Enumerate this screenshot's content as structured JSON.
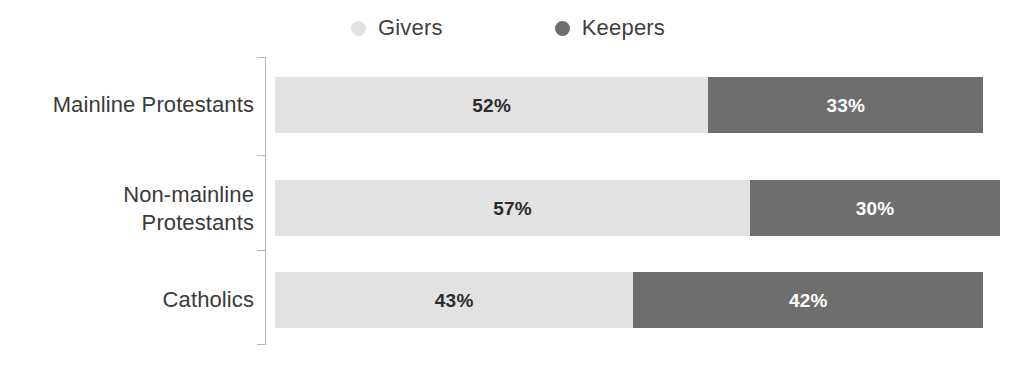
{
  "legend": {
    "position": "top-center",
    "items": [
      {
        "label": "Givers",
        "color": "#e2e2e2",
        "icon": "circle-marker-icon"
      },
      {
        "label": "Keepers",
        "color": "#6e6e6e",
        "icon": "circle-marker-icon"
      }
    ]
  },
  "colors": {
    "givers": "#e2e2e2",
    "keepers": "#6e6e6e",
    "axis": "#b8b8b8",
    "category_label": "#3a3a3a",
    "legend_label": "#3f3f3f",
    "givers_value_text": "#2b2b2b",
    "keepers_value_text": "#ffffff",
    "background": "#ffffff"
  },
  "chart_data": {
    "type": "bar",
    "orientation": "horizontal",
    "stacked": true,
    "title": "",
    "subtitle": "",
    "xlabel": "",
    "ylabel": "",
    "grid": false,
    "legend_position": "top-center",
    "categories": [
      "Mainline Protestants",
      "Non-mainline Protestants",
      "Catholics"
    ],
    "series": [
      {
        "name": "Givers",
        "values": [
          52,
          57,
          43
        ],
        "color": "#e2e2e2"
      },
      {
        "name": "Keepers",
        "values": [
          33,
          30,
          42
        ],
        "color": "#6e6e6e"
      }
    ],
    "value_labels": [
      [
        "52%",
        "33%"
      ],
      [
        "57%",
        "30%"
      ],
      [
        "43%",
        "42%"
      ]
    ],
    "totals": [
      85,
      87,
      85
    ],
    "units": "percent",
    "xlim": [
      0,
      87
    ]
  },
  "rows": [
    {
      "category": "Mainline Protestants",
      "category_display": "Mainline Protestants",
      "givers_label": "52%",
      "keepers_label": "33%",
      "givers_value": 52,
      "keepers_value": 33
    },
    {
      "category": "Non-mainline Protestants",
      "category_display": "Non-mainline\nProtestants",
      "givers_label": "57%",
      "keepers_label": "30%",
      "givers_value": 57,
      "keepers_value": 30
    },
    {
      "category": "Catholics",
      "category_display": "Catholics",
      "givers_label": "43%",
      "keepers_label": "42%",
      "givers_value": 43,
      "keepers_value": 42
    }
  ]
}
